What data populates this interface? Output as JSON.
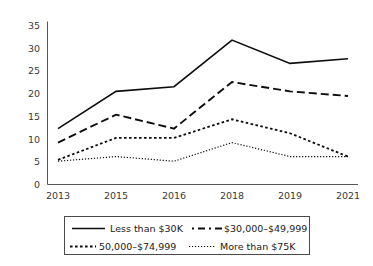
{
  "chart_data": {
    "type": "line",
    "title": "",
    "xlabel": "",
    "ylabel": "",
    "categories": [
      "2013",
      "2015",
      "2016",
      "2018",
      "2019",
      "2021"
    ],
    "ylim": [
      0,
      35
    ],
    "yticks": [
      0,
      5,
      10,
      15,
      20,
      25,
      30,
      35
    ],
    "grid": false,
    "legend_position": "bottom",
    "series": [
      {
        "name": "Less than $30K",
        "style": "solid",
        "values": [
          12,
          20,
          21,
          31,
          26,
          27
        ]
      },
      {
        "name": "$30,000–$49,999",
        "style": "dashed",
        "values": [
          9,
          15,
          12,
          22,
          20,
          19
        ]
      },
      {
        "name": "50,000–$74,999",
        "style": "dotted-medium",
        "values": [
          5.3,
          10,
          10,
          14,
          11,
          6
        ]
      },
      {
        "name": "More than $75K",
        "style": "dotted-fine",
        "values": [
          5,
          6,
          5,
          9,
          6,
          6
        ]
      }
    ]
  },
  "axis": {
    "y_tick_labels": [
      "0",
      "5",
      "10",
      "15",
      "20",
      "25",
      "30",
      "35"
    ],
    "x_tick_labels": [
      "2013",
      "2015",
      "2016",
      "2018",
      "2019",
      "2021"
    ]
  },
  "legend": {
    "items": [
      {
        "label": "Less than $30K",
        "style": "solid"
      },
      {
        "label": "$30,000–$49,999",
        "style": "dashed"
      },
      {
        "label": "50,000–$74,999",
        "style": "dotted-medium"
      },
      {
        "label": "More than $75K",
        "style": "dotted-fine"
      }
    ]
  },
  "colors": {
    "background": "#ffffff",
    "line": "#0d0d0d",
    "axis": "#555555",
    "text": "#1a1a1a",
    "tick_text": "#3b3b3b",
    "legend_border": "#4a4a4a"
  }
}
